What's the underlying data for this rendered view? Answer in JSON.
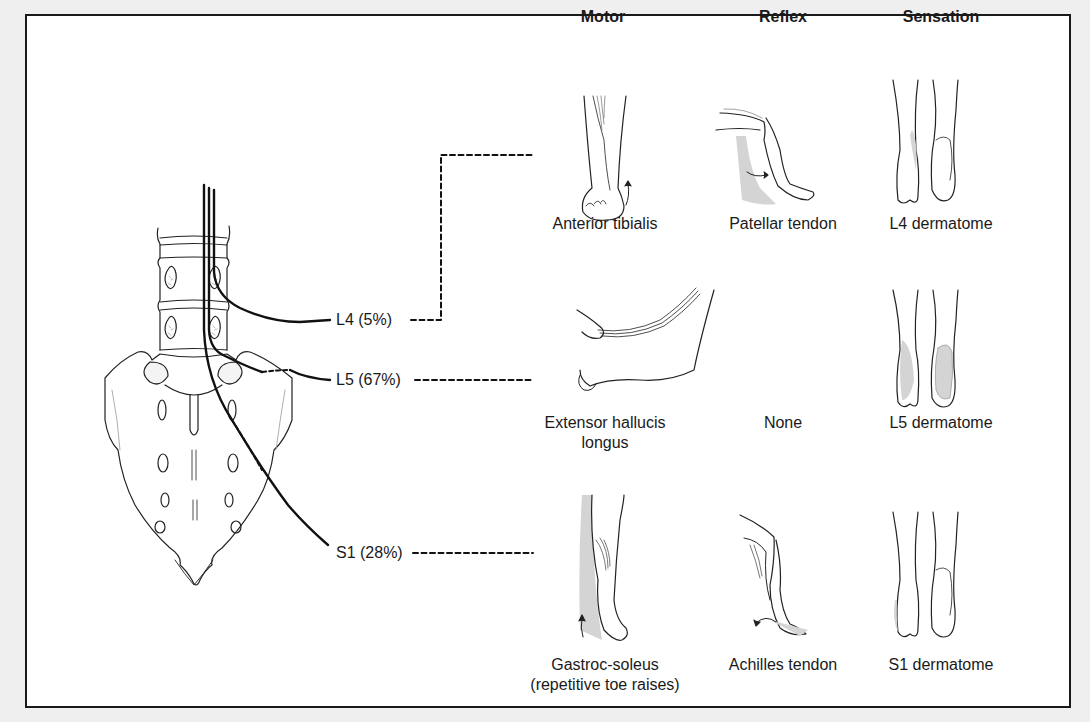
{
  "figure": {
    "columns": [
      {
        "key": "motor",
        "label": "Motor"
      },
      {
        "key": "reflex",
        "label": "Reflex"
      },
      {
        "key": "sensation",
        "label": "Sensation"
      }
    ],
    "nerve_roots": [
      {
        "label": "L4 (5%)",
        "root": "L4",
        "percent": 5,
        "motor": {
          "caption_line1": "Anterior tibialis",
          "caption_line2": ""
        },
        "reflex": {
          "caption": "Patellar tendon"
        },
        "sensation": {
          "caption": "L4 dermatome"
        }
      },
      {
        "label": "L5 (67%)",
        "root": "L5",
        "percent": 67,
        "motor": {
          "caption_line1": "Extensor hallucis",
          "caption_line2": "longus"
        },
        "reflex": {
          "caption": "None"
        },
        "sensation": {
          "caption": "L5 dermatome"
        }
      },
      {
        "label": "S1 (28%)",
        "root": "S1",
        "percent": 28,
        "motor": {
          "caption_line1": "Gastroc-soleus",
          "caption_line2": "(repetitive toe raises)"
        },
        "reflex": {
          "caption": "Achilles tendon"
        },
        "sensation": {
          "caption": "S1 dermatome"
        }
      }
    ],
    "colors": {
      "background": "#efefef",
      "panel": "#ffffff",
      "ink": "#1a1a1a",
      "shading": "#d4d4d4"
    }
  }
}
